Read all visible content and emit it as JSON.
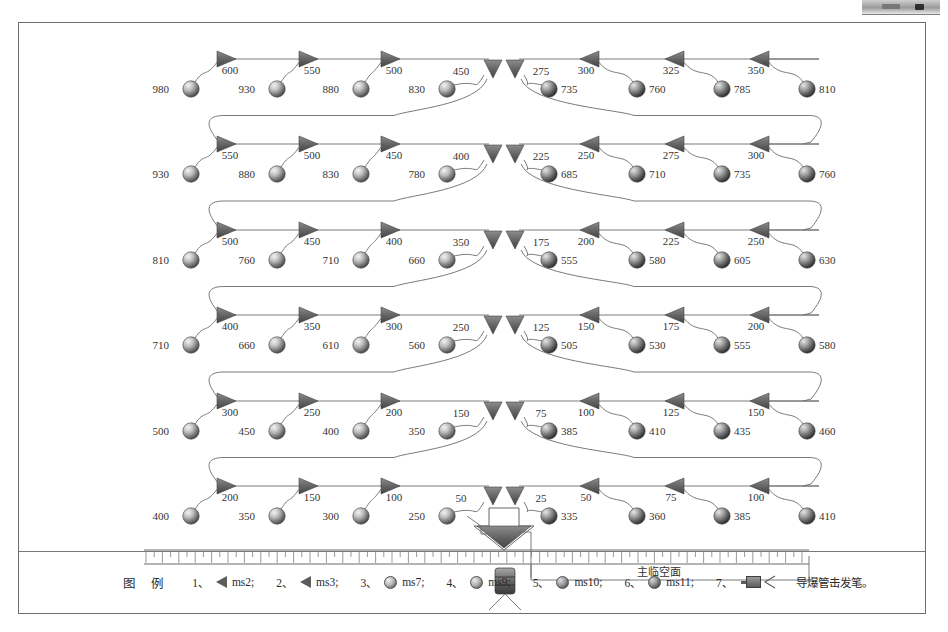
{
  "diagram": {
    "title_note": "",
    "free_face_label": "主临空面",
    "legend_title": "图 例",
    "legend_items": [
      {
        "num": "1、",
        "symbol": "tri-left",
        "label": "ms2;"
      },
      {
        "num": "2、",
        "symbol": "tri-left",
        "label": "ms3;"
      },
      {
        "num": "3、",
        "symbol": "ball",
        "label": "ms7;"
      },
      {
        "num": "4、",
        "symbol": "ball",
        "label": "ms9;"
      },
      {
        "num": "5、",
        "symbol": "ball",
        "label": "ms10;"
      },
      {
        "num": "6、",
        "symbol": "ball",
        "label": "ms11;"
      },
      {
        "num": "7、",
        "symbol": "pen",
        "label": "导爆管击发笔。"
      }
    ]
  },
  "chart_data": {
    "type": "diagram",
    "xlabel": "",
    "ylabel": "",
    "columns": 8,
    "rows": 6,
    "rows_data": [
      {
        "row": 1,
        "surface_delays": [
          600,
          550,
          500,
          450,
          275,
          300,
          325,
          350
        ],
        "hole_delays": [
          980,
          930,
          880,
          830,
          735,
          760,
          785,
          810
        ]
      },
      {
        "row": 2,
        "surface_delays": [
          550,
          500,
          450,
          400,
          225,
          250,
          275,
          300
        ],
        "hole_delays": [
          930,
          880,
          830,
          780,
          685,
          710,
          735,
          760
        ]
      },
      {
        "row": 3,
        "surface_delays": [
          500,
          450,
          400,
          350,
          175,
          200,
          225,
          250
        ],
        "hole_delays": [
          810,
          760,
          710,
          660,
          555,
          580,
          605,
          630
        ]
      },
      {
        "row": 4,
        "surface_delays": [
          400,
          350,
          300,
          250,
          125,
          150,
          175,
          200
        ],
        "hole_delays": [
          710,
          660,
          610,
          560,
          505,
          530,
          555,
          580
        ]
      },
      {
        "row": 5,
        "surface_delays": [
          300,
          250,
          200,
          150,
          75,
          100,
          125,
          150
        ],
        "hole_delays": [
          500,
          450,
          400,
          350,
          385,
          410,
          435,
          460
        ]
      },
      {
        "row": 6,
        "surface_delays": [
          200,
          150,
          100,
          50,
          25,
          50,
          75,
          100
        ],
        "hole_delays": [
          400,
          350,
          300,
          250,
          335,
          360,
          385,
          410
        ]
      }
    ],
    "units": "ms",
    "initiation_point": "bottom center",
    "scale_bar": true
  }
}
